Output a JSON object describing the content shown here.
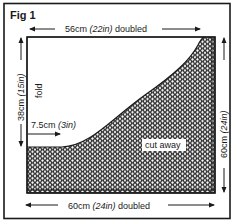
{
  "figure": {
    "title": "Fig 1",
    "top_dimension": {
      "value": "56cm",
      "imperial": "(22in)",
      "suffix": "doubled"
    },
    "bottom_dimension": {
      "value": "60cm",
      "imperial": "(24in)",
      "suffix": "doubled"
    },
    "left_dimension": {
      "value": "38cm",
      "imperial": "(15in)"
    },
    "right_dimension": {
      "value": "60cm",
      "imperial": "(24in)"
    },
    "fold_label": "fold",
    "inset_dimension": {
      "value": "7.5cm",
      "imperial": "(3in)"
    },
    "cut_label": "cut away",
    "colors": {
      "ink": "#1a1a1a",
      "paper": "#ffffff"
    }
  }
}
